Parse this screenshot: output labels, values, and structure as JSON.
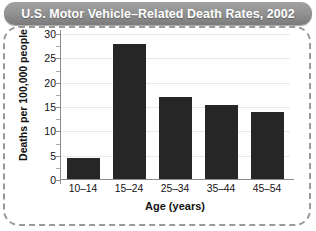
{
  "title": "U.S. Motor Vehicle–Related Death Rates, 2002",
  "chart_data": {
    "type": "bar",
    "title": "U.S. Motor Vehicle–Related Death Rates, 2002",
    "categories": [
      "10–14",
      "15–24",
      "25–34",
      "35–44",
      "45–54"
    ],
    "values": [
      4.5,
      28,
      17,
      15.5,
      14
    ],
    "xlabel": "Age (years)",
    "ylabel": "Deaths per 100,000 people",
    "ylim": [
      0,
      30
    ],
    "ytick_labels": [
      "0",
      "5",
      "10",
      "15",
      "20",
      "25",
      "30"
    ],
    "ytick_values": [
      0,
      5,
      10,
      15,
      20,
      25,
      30
    ],
    "minor_tick_interval": 2.5,
    "grid": "horizontal",
    "legend": "none",
    "bar_color": "#262626",
    "grid_color": "#e9e9e9",
    "axis_color": "#8d8d8d"
  },
  "style": {
    "title_bar_color": "#8f8f8f",
    "title_text_color": "#ffffff",
    "border_color": "#9a9a9a",
    "background": "#ffffff"
  }
}
